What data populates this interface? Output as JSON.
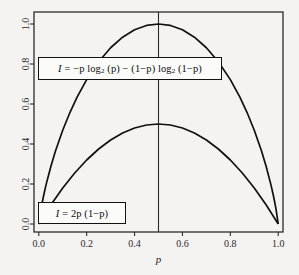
{
  "chart_data": {
    "type": "line",
    "title": "",
    "subtitle": "",
    "xlabel": "p",
    "ylabel": "",
    "xlim": [
      -0.02,
      1.02
    ],
    "ylim": [
      -0.04,
      1.06
    ],
    "xticks": [
      "0.0",
      "0.2",
      "0.4",
      "0.6",
      "0.8",
      "1.0"
    ],
    "xtick_values": [
      0.0,
      0.2,
      0.4,
      0.6,
      0.8,
      1.0
    ],
    "yticks": [
      "0.0",
      "0.2",
      "0.4",
      "0.6",
      "0.8",
      "1.0"
    ],
    "ytick_values": [
      0.0,
      0.2,
      0.4,
      0.6,
      0.8,
      1.0
    ],
    "grid": false,
    "legend_position": "none",
    "frame": "box",
    "reference_lines": [
      {
        "name": "vertical-line-at-half",
        "orientation": "vertical",
        "x": 0.5
      }
    ],
    "series": [
      {
        "name": "entropy",
        "formula_text": "I = -p log2 (p) - (1-p) log2 (1-p)",
        "x": [
          0.0,
          0.01,
          0.02,
          0.03,
          0.05,
          0.07,
          0.1,
          0.13,
          0.16,
          0.2,
          0.25,
          0.3,
          0.35,
          0.4,
          0.45,
          0.5,
          0.55,
          0.6,
          0.65,
          0.7,
          0.75,
          0.8,
          0.84,
          0.87,
          0.9,
          0.93,
          0.95,
          0.97,
          0.98,
          0.99,
          1.0
        ],
        "values": [
          0.0,
          0.0808,
          0.1414,
          0.1944,
          0.2864,
          0.3659,
          0.469,
          0.5574,
          0.634,
          0.7219,
          0.8113,
          0.8813,
          0.9341,
          0.971,
          0.9928,
          1.0,
          0.9928,
          0.971,
          0.9341,
          0.8813,
          0.8113,
          0.7219,
          0.634,
          0.5574,
          0.469,
          0.3659,
          0.2864,
          0.1944,
          0.1414,
          0.0808,
          0.0
        ]
      },
      {
        "name": "gini",
        "formula_text": "I = 2p (1-p)",
        "x": [
          0.0,
          0.05,
          0.1,
          0.15,
          0.2,
          0.25,
          0.3,
          0.35,
          0.4,
          0.45,
          0.5,
          0.55,
          0.6,
          0.65,
          0.7,
          0.75,
          0.8,
          0.85,
          0.9,
          0.95,
          1.0
        ],
        "values": [
          0.0,
          0.095,
          0.18,
          0.255,
          0.32,
          0.375,
          0.42,
          0.455,
          0.48,
          0.495,
          0.5,
          0.495,
          0.48,
          0.455,
          0.42,
          0.375,
          0.32,
          0.255,
          0.18,
          0.095,
          0.0
        ]
      }
    ],
    "annotations": [
      {
        "name": "entropy-formula-label",
        "x": 0.04,
        "y": 0.795,
        "parts": {
          "lead": "I",
          "eq": " = ",
          "body": "−p log",
          "sub1": "2",
          "mid": " (p) − (1−p) log",
          "sub2": "2",
          "tail": " (1−p)"
        }
      },
      {
        "name": "gini-formula-label",
        "x": 0.04,
        "y": 0.135,
        "parts": {
          "lead": "I",
          "eq": " = ",
          "body": "2p (1−p)"
        }
      }
    ],
    "colors": {
      "background": "#f4f3f1",
      "curve": "#111111",
      "frame": "#2b2b2b",
      "reference_line": "#2b2b2b",
      "box_fill": "#fbfbfa",
      "box_border": "#111111",
      "tick_text": "#2a2a2a"
    }
  }
}
